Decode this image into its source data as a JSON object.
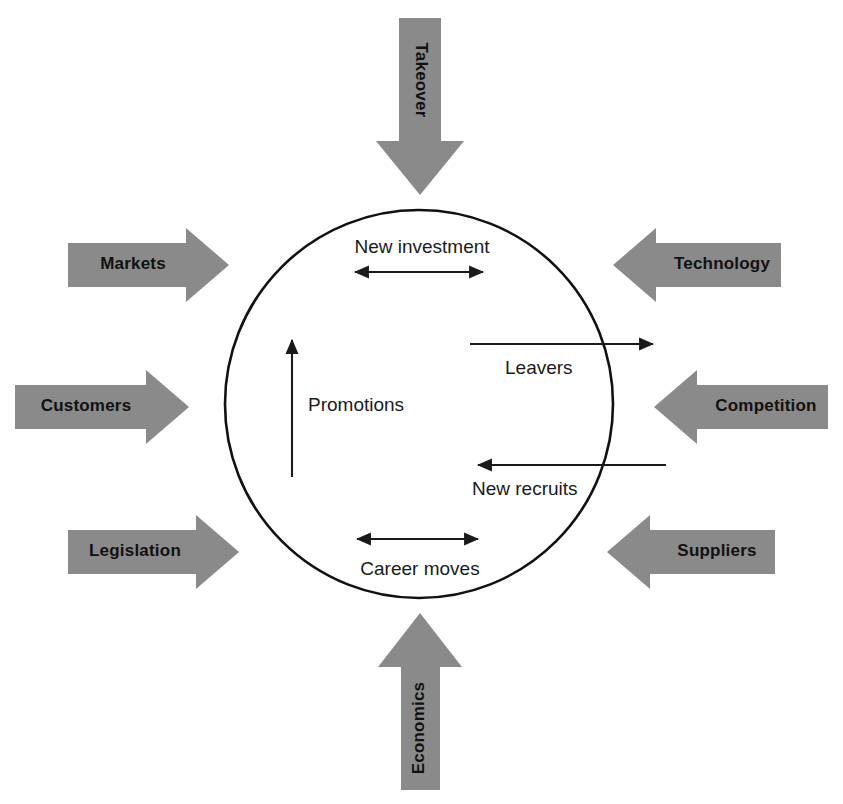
{
  "diagram": {
    "type": "systems-environment-diagram",
    "background_color": "#ffffff",
    "arrow_fill_color": "#8a8a8a",
    "line_color": "#1a1a1a",
    "center": {
      "shape": "circle",
      "cx": 419,
      "cy": 404,
      "r": 194,
      "fill": "#ffffff",
      "stroke": "#111111"
    },
    "external_forces": [
      {
        "id": "takeover",
        "label": "Takeover",
        "side": "top",
        "direction": "down",
        "orientation": "vertical",
        "text_rotation": 90
      },
      {
        "id": "markets",
        "label": "Markets",
        "side": "left",
        "direction": "right",
        "orientation": "horizontal",
        "text_rotation": 0
      },
      {
        "id": "customers",
        "label": "Customers",
        "side": "left",
        "direction": "right",
        "orientation": "horizontal",
        "text_rotation": 0
      },
      {
        "id": "legislation",
        "label": "Legislation",
        "side": "left",
        "direction": "right",
        "orientation": "horizontal",
        "text_rotation": 0
      },
      {
        "id": "technology",
        "label": "Technology",
        "side": "right",
        "direction": "left",
        "orientation": "horizontal",
        "text_rotation": 0
      },
      {
        "id": "competition",
        "label": "Competition",
        "side": "right",
        "direction": "left",
        "orientation": "horizontal",
        "text_rotation": 0
      },
      {
        "id": "suppliers",
        "label": "Suppliers",
        "side": "right",
        "direction": "left",
        "orientation": "horizontal",
        "text_rotation": 0
      },
      {
        "id": "economics",
        "label": "Economics",
        "side": "bottom",
        "direction": "up",
        "orientation": "vertical",
        "text_rotation": 90
      }
    ],
    "internal_flows": [
      {
        "id": "new-investment",
        "label": "New investment",
        "arrow_type": "double-headed",
        "orientation": "horizontal",
        "label_position": "above"
      },
      {
        "id": "leavers",
        "label": "Leavers",
        "arrow_type": "single-headed",
        "direction": "right-outward",
        "orientation": "horizontal",
        "label_position": "below"
      },
      {
        "id": "promotions",
        "label": "Promotions",
        "arrow_type": "single-headed",
        "direction": "up",
        "orientation": "vertical",
        "label_position": "right"
      },
      {
        "id": "new-recruits",
        "label": "New recruits",
        "arrow_type": "single-headed",
        "direction": "left-inward",
        "orientation": "horizontal",
        "label_position": "below"
      },
      {
        "id": "career-moves",
        "label": "Career moves",
        "arrow_type": "double-headed",
        "orientation": "horizontal",
        "label_position": "below"
      }
    ]
  }
}
